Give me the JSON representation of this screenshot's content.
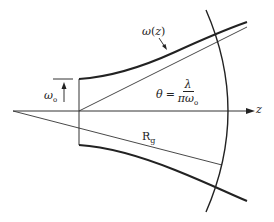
{
  "figure": {
    "type": "gaussian-beam-propagation",
    "labels": {
      "beam_radius": {
        "symbol": "ω",
        "arg_open": "(",
        "arg": "z",
        "arg_close": ")"
      },
      "waist": {
        "symbol": "ω",
        "subscript": "o"
      },
      "axis": "z",
      "divergence": {
        "lhs": "θ",
        "equals": "=",
        "numerator": "λ",
        "denominator_main": "πω",
        "denominator_sub": "o"
      },
      "radius_of_curvature": {
        "symbol": "R",
        "subscript": "g"
      }
    },
    "colors": {
      "line": "#222222",
      "thin_line": "#333333",
      "background": "#ffffff"
    }
  }
}
